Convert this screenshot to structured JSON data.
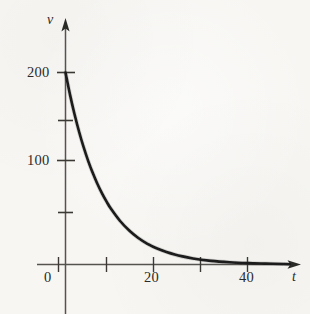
{
  "figure": {
    "background_color": "#f7f6f3",
    "ink_color": "#2b2a28",
    "curve_color": "#1a1a1a"
  },
  "chart_data": {
    "type": "line",
    "title": "",
    "subtitle": "",
    "xlabel": "t",
    "ylabel": "v",
    "grid": false,
    "legend": null,
    "annotations": [],
    "xlim": [
      -6,
      50
    ],
    "ylim": [
      0,
      215
    ],
    "x_ticks": [
      10,
      20,
      30,
      40
    ],
    "x_tick_labels": [
      "",
      "20",
      "",
      "40"
    ],
    "y_ticks": [
      50,
      100,
      150,
      200
    ],
    "y_tick_labels": [
      "",
      "100",
      "",
      "200"
    ],
    "origin_label": "0",
    "series": [
      {
        "name": "v(t)",
        "equation": "v = 200 e^(-0.124 t)",
        "x": [
          0,
          1,
          2,
          3,
          4,
          5,
          6,
          7,
          8,
          9,
          10,
          12,
          14,
          16,
          18,
          20,
          24,
          28,
          32,
          36,
          40,
          44,
          48
        ],
        "values": [
          200,
          176.7,
          156.2,
          138.0,
          121.9,
          107.7,
          95.2,
          84.1,
          74.3,
          65.7,
          58.0,
          45.3,
          35.4,
          27.6,
          21.6,
          16.9,
          10.3,
          6.3,
          3.8,
          2.3,
          1.4,
          0.9,
          0.5
        ]
      }
    ]
  },
  "axes": {
    "y_axis_name": "v",
    "x_axis_name": "t",
    "y_labels": [
      {
        "id": "200",
        "text": "200",
        "value": 200
      },
      {
        "id": "100",
        "text": "100",
        "value": 100
      }
    ],
    "x_labels": [
      {
        "id": "20",
        "text": "20",
        "value": 20
      },
      {
        "id": "40",
        "text": "40",
        "value": 40
      }
    ],
    "origin": "0"
  }
}
